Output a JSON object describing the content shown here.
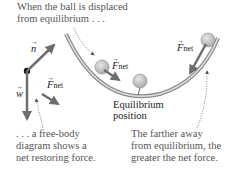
{
  "captions": {
    "top_line1": "When the ball is displaced",
    "top_line2": "from equilibrium . . .",
    "left_line1": ". . . a free-body",
    "left_line2": "diagram shows a",
    "left_line3": "net restoring force.",
    "right_line1": "The farther away",
    "right_line2": "from equilibrium, the",
    "right_line3": "greater the net force."
  },
  "labels": {
    "normal_force": "n",
    "weight": "w",
    "fnet_main": "F",
    "fnet_sub": "net",
    "equilibrium_line1": "Equilibrium",
    "equilibrium_line2": "position"
  },
  "colors": {
    "vector": "#6e6e6e",
    "bowl": "#8a8a8a",
    "ball": "#b8b8b8",
    "text": "#555555"
  }
}
